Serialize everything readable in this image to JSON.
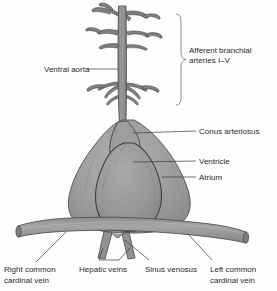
{
  "figure": {
    "background_color": "#fdfdfd",
    "ink_color": "#2b2b2b",
    "tissue_fill": "#9a9a9a",
    "tissue_fill_light": "#a8a8a8",
    "tissue_fill_dark": "#8c8c8c",
    "outline_color": "#4f4f4f",
    "leader_color": "#3a3a3a"
  },
  "labels": {
    "ventral_aorta": "Ventral aorta",
    "afferent_branchial_line1": "Afferent branchial",
    "afferent_branchial_line2": "arteries I–V",
    "conus_arteriosus": "Conus arteriosus",
    "ventricle": "Ventricle",
    "atrium": "Atrium",
    "right_common_line1": "Right common",
    "right_common_line2": "cardinal vein",
    "hepatic_veins": "Hepatic veins",
    "sinus_venosus": "Sinus venosus",
    "left_common_line1": "Left common",
    "left_common_line2": "cardinal vein"
  },
  "structures": [
    {
      "name": "ventral-aorta",
      "label": "Ventral aorta"
    },
    {
      "name": "afferent-branchial-arteries",
      "label": "Afferent branchial arteries I–V",
      "count": 5
    },
    {
      "name": "conus-arteriosus",
      "label": "Conus arteriosus"
    },
    {
      "name": "ventricle",
      "label": "Ventricle"
    },
    {
      "name": "atrium",
      "label": "Atrium"
    },
    {
      "name": "sinus-venosus",
      "label": "Sinus venosus"
    },
    {
      "name": "hepatic-veins",
      "label": "Hepatic veins"
    },
    {
      "name": "right-common-cardinal-vein",
      "label": "Right common cardinal vein"
    },
    {
      "name": "left-common-cardinal-vein",
      "label": "Left common cardinal vein"
    }
  ]
}
